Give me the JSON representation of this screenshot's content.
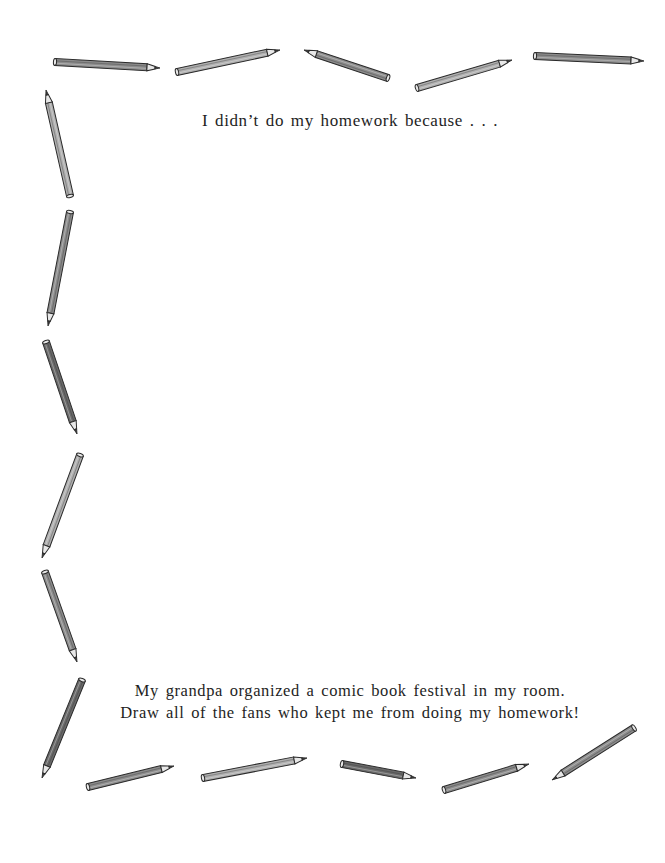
{
  "page": {
    "heading": "I didn’t do my homework because . . .",
    "prompt_lines": [
      "My grandpa organized a comic book festival in my room.",
      "Draw all of the fans who kept me from doing my homework!"
    ],
    "drawing_area": "blank space for drawing"
  },
  "border": {
    "style": "hand-drawn pencils framing the page (top, left and bottom edges)",
    "colors": {
      "pencil_body": "#8c8c8c",
      "pencil_dark": "#6a6a6a",
      "pencil_light": "#b0b0b0",
      "outline": "#2a2a2a",
      "wood": "#e8e8e8",
      "lead": "#3a3a3a"
    },
    "pencils": [
      {
        "edge": "top",
        "x1": 55,
        "y1": 62,
        "x2": 160,
        "y2": 68,
        "shade": "mid"
      },
      {
        "edge": "top",
        "x1": 177,
        "y1": 72,
        "x2": 280,
        "y2": 50,
        "shade": "light"
      },
      {
        "edge": "top",
        "x1": 388,
        "y1": 78,
        "x2": 304,
        "y2": 50,
        "shade": "mid"
      },
      {
        "edge": "top",
        "x1": 417,
        "y1": 88,
        "x2": 512,
        "y2": 60,
        "shade": "light"
      },
      {
        "edge": "top",
        "x1": 535,
        "y1": 56,
        "x2": 644,
        "y2": 61,
        "shade": "mid"
      },
      {
        "edge": "left",
        "x1": 70,
        "y1": 196,
        "x2": 46,
        "y2": 90,
        "shade": "light"
      },
      {
        "edge": "left",
        "x1": 70,
        "y1": 212,
        "x2": 48,
        "y2": 326,
        "shade": "mid"
      },
      {
        "edge": "left",
        "x1": 46,
        "y1": 342,
        "x2": 77,
        "y2": 434,
        "shade": "dark"
      },
      {
        "edge": "left",
        "x1": 80,
        "y1": 455,
        "x2": 42,
        "y2": 558,
        "shade": "light"
      },
      {
        "edge": "left",
        "x1": 45,
        "y1": 572,
        "x2": 77,
        "y2": 662,
        "shade": "mid"
      },
      {
        "edge": "left",
        "x1": 82,
        "y1": 680,
        "x2": 42,
        "y2": 778,
        "shade": "dark"
      },
      {
        "edge": "bottom",
        "x1": 88,
        "y1": 787,
        "x2": 174,
        "y2": 766,
        "shade": "mid"
      },
      {
        "edge": "bottom",
        "x1": 203,
        "y1": 778,
        "x2": 307,
        "y2": 758,
        "shade": "light"
      },
      {
        "edge": "bottom",
        "x1": 342,
        "y1": 764,
        "x2": 416,
        "y2": 778,
        "shade": "dark"
      },
      {
        "edge": "bottom",
        "x1": 444,
        "y1": 790,
        "x2": 529,
        "y2": 764,
        "shade": "mid"
      },
      {
        "edge": "bottom",
        "x1": 634,
        "y1": 728,
        "x2": 552,
        "y2": 780,
        "shade": "mid"
      }
    ]
  }
}
